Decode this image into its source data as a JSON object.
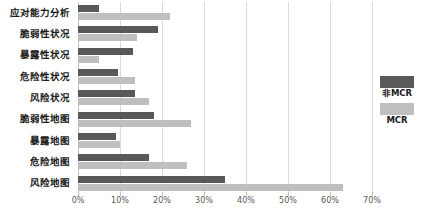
{
  "chart_data": {
    "type": "bar",
    "orientation": "horizontal",
    "title": "",
    "xlabel": "",
    "ylabel": "",
    "xlim": [
      0,
      70
    ],
    "xtick_labels": [
      "0%",
      "10%",
      "20%",
      "30%",
      "40%",
      "50%",
      "60%",
      "70%"
    ],
    "xticks": [
      0,
      10,
      20,
      30,
      40,
      50,
      60,
      70
    ],
    "grid": "vertical",
    "legend_position": "right",
    "categories": [
      "应对能力分析",
      "脆弱性状况",
      "暴露性状况",
      "危险性状况",
      "风险状况",
      "脆弱性地图",
      "暴露地图",
      "危险地图",
      "风险地图"
    ],
    "series": [
      {
        "name": "非MCR",
        "color": "#595959",
        "values": [
          5,
          19,
          13,
          9.5,
          13.5,
          18,
          9,
          17,
          35
        ]
      },
      {
        "name": "MCR",
        "color": "#bfbfbf",
        "values": [
          22,
          14,
          5,
          13.5,
          17,
          27,
          10,
          26,
          63
        ]
      }
    ]
  },
  "legend": {
    "items": [
      {
        "label": "非MCR",
        "color": "#595959"
      },
      {
        "label": "MCR",
        "color": "#bfbfbf"
      }
    ]
  }
}
